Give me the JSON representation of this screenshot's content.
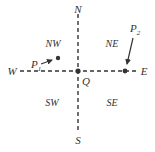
{
  "diagram": {
    "type": "compass-quadrant",
    "colors": {
      "line": "#333333",
      "text": "#333333",
      "background": "#ffffff"
    },
    "axes": {
      "north_label": "N",
      "south_label": "S",
      "east_label": "E",
      "west_label": "W",
      "style": "dashed"
    },
    "origin": {
      "label": "Q"
    },
    "quadrants": {
      "nw": "NW",
      "ne": "NE",
      "sw": "SW",
      "se": "SE"
    },
    "points": [
      {
        "id": "p1",
        "label_main": "P",
        "label_sub": "1",
        "location": "NW quadrant"
      },
      {
        "id": "p2",
        "label_main": "P",
        "label_sub": "2",
        "location": "on east axis"
      }
    ]
  }
}
